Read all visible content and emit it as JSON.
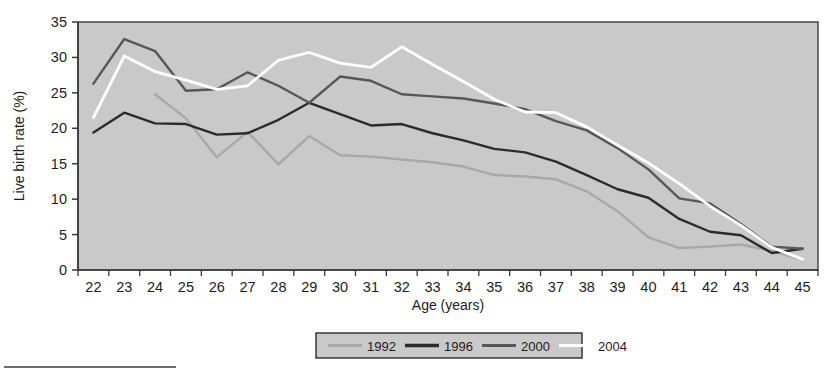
{
  "chart_data": {
    "type": "line",
    "title": "",
    "xlabel": "Age (years)",
    "ylabel": "Live birth rate (%)",
    "xlim": [
      22,
      45
    ],
    "ylim": [
      0,
      35
    ],
    "ytick_step": 5,
    "grid": false,
    "legend_position": "bottom",
    "categories": [
      22,
      23,
      24,
      25,
      26,
      27,
      28,
      29,
      30,
      31,
      32,
      33,
      34,
      35,
      36,
      37,
      38,
      39,
      40,
      41,
      42,
      43,
      44,
      45
    ],
    "xticklabels": [
      "22",
      "23",
      "24",
      "25",
      "26",
      "27",
      "28",
      "29",
      "30",
      "31",
      "32",
      "33",
      "34",
      "35",
      "36",
      "37",
      "38",
      "39",
      "40",
      "41",
      "42",
      "43",
      "44",
      "45"
    ],
    "yticklabels": [
      "0",
      "5",
      "10",
      "15",
      "20",
      "25",
      "30",
      "35"
    ],
    "series": [
      {
        "name": "1992",
        "color": "#a8a8a8",
        "start_index": 2,
        "values": [
          null,
          null,
          24.8,
          21.4,
          15.9,
          19.5,
          14.9,
          18.9,
          16.2,
          16.0,
          15.6,
          15.2,
          14.6,
          13.4,
          13.2,
          12.8,
          11.1,
          8.3,
          4.6,
          3.1,
          3.3,
          3.6,
          2.7,
          1.4
        ]
      },
      {
        "name": "1996",
        "color": "#2b2b2b",
        "start_index": 0,
        "values": [
          19.4,
          22.2,
          20.7,
          20.6,
          19.1,
          19.3,
          21.2,
          23.6,
          22.0,
          20.4,
          20.6,
          19.3,
          18.3,
          17.1,
          16.6,
          15.3,
          13.4,
          11.4,
          10.2,
          7.2,
          5.4,
          4.9,
          2.4,
          3.0
        ]
      },
      {
        "name": "2000",
        "color": "#575757",
        "start_index": 0,
        "values": [
          26.3,
          32.6,
          30.9,
          25.3,
          25.5,
          27.9,
          26.0,
          23.6,
          27.3,
          26.7,
          24.8,
          24.5,
          24.2,
          23.5,
          22.7,
          21.0,
          19.7,
          17.2,
          14.2,
          10.1,
          9.4,
          6.5,
          3.3,
          3.0
        ]
      },
      {
        "name": "2004",
        "color": "#ffffff",
        "start_index": 0,
        "values": [
          21.5,
          30.2,
          28.0,
          26.8,
          25.5,
          26.0,
          29.6,
          30.7,
          29.2,
          28.6,
          31.5,
          29.0,
          26.6,
          24.1,
          22.3,
          22.2,
          20.2,
          17.6,
          15.1,
          12.2,
          9.0,
          6.3,
          3.2,
          1.5
        ]
      }
    ]
  },
  "legend": {
    "items": [
      {
        "label": "1992",
        "color": "#a8a8a8"
      },
      {
        "label": "1996",
        "color": "#2b2b2b"
      },
      {
        "label": "2000",
        "color": "#575757"
      },
      {
        "label": "2004",
        "color": "#ffffff"
      }
    ]
  },
  "style": {
    "plot_background": "#c9c9c9",
    "page_background": "#ffffff",
    "axis_color": "#3a3a3a",
    "legend_background": "#c9c9c9"
  }
}
